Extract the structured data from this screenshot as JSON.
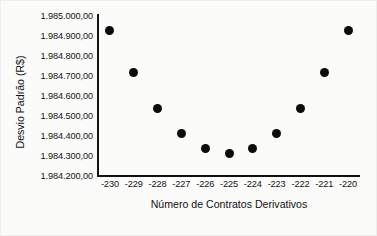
{
  "chart_data": {
    "type": "scatter",
    "title": "",
    "xlabel": "Número de Contratos Derivativos",
    "ylabel": "Desvio Padrão (R$)",
    "x": [
      -230,
      -229,
      -228,
      -227,
      -226,
      -225,
      -224,
      -223,
      -222,
      -221,
      -220
    ],
    "values": [
      1984930,
      1984720,
      1984540,
      1984415,
      1984340,
      1984315,
      1984340,
      1984415,
      1984540,
      1984720,
      1984930
    ],
    "xtick_labels": [
      "-230",
      "-229",
      "-228",
      "-227",
      "-226",
      "-225",
      "-224",
      "-223",
      "-222",
      "-221",
      "-220"
    ],
    "ytick_labels": [
      "1.985.000,00",
      "1.984.900,00",
      "1.984.800,00",
      "1.984.700,00",
      "1.984.600,00",
      "1.984.500,00",
      "1.984.400,00",
      "1.984.300,00",
      "1.984.200,00"
    ],
    "ytick_values": [
      1985000,
      1984900,
      1984800,
      1984700,
      1984600,
      1984500,
      1984400,
      1984300,
      1984200
    ],
    "ylim": [
      1984200,
      1985000
    ],
    "xlim": [
      -230.5,
      -219.5
    ],
    "grid": false,
    "legend": false,
    "marker_color": "#0b0b0b",
    "axis_color": "#111111"
  }
}
